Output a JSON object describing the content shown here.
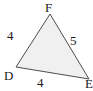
{
  "figure": {
    "kind": "geometry-triangle-diagram",
    "width": 93,
    "height": 91,
    "background_color": "#ffffff",
    "fill_color": "#f0f0f0",
    "stroke_color": "#4d4d4d",
    "stroke_width": 1,
    "label_color": "#1a1a1a",
    "vertices": [
      {
        "name": "D",
        "label": "D",
        "x": 16,
        "y": 67
      },
      {
        "name": "E",
        "label": "E",
        "x": 89,
        "y": 79,
        "clipped_at_right_edge": true
      },
      {
        "name": "F",
        "label": "F",
        "x": 50,
        "y": 14
      }
    ],
    "sides": [
      {
        "name": "DF",
        "label": "4",
        "from": "D",
        "to": "F"
      },
      {
        "name": "FE",
        "label": "5",
        "from": "F",
        "to": "E"
      },
      {
        "name": "DE",
        "label": "4",
        "from": "D",
        "to": "E"
      }
    ],
    "polygon_points": "16,67 50,14 89,79"
  }
}
